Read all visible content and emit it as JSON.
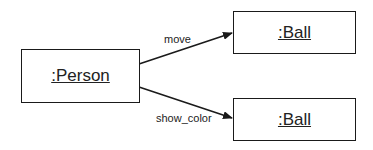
{
  "diagram": {
    "type": "UML communication/object diagram",
    "objects": [
      {
        "id": "person",
        "label": ":Person"
      },
      {
        "id": "ball1",
        "label": ":Ball"
      },
      {
        "id": "ball2",
        "label": ":Ball"
      }
    ],
    "messages": [
      {
        "from": "person",
        "to": "ball1",
        "label": "move"
      },
      {
        "from": "person",
        "to": "ball2",
        "label": "show_color"
      }
    ],
    "colors": {
      "line": "#1a1a1a",
      "background": "#ffffff",
      "text": "#222222"
    }
  }
}
